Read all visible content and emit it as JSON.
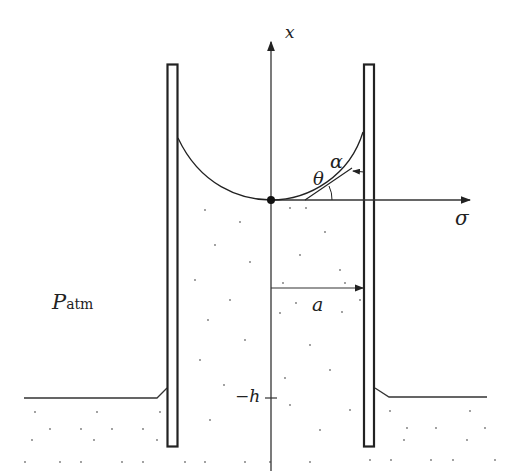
{
  "diagram": {
    "labels": {
      "x_axis": "x",
      "sigma_axis": "σ",
      "theta": "θ",
      "alpha": "α",
      "radius": "a",
      "depth": "−h",
      "pressure_main": "P",
      "pressure_sub": "atm"
    },
    "colors": {
      "stroke": "#222222",
      "dots": "#666666",
      "background": "#ffffff"
    }
  }
}
